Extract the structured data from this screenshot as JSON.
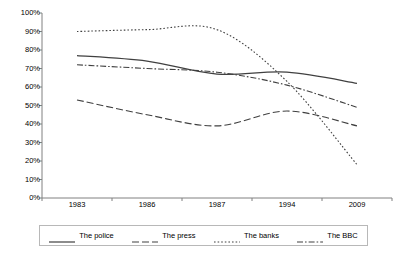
{
  "chart_data": {
    "type": "line",
    "title": "",
    "xlabel": "",
    "ylabel": "",
    "categories": [
      "1983",
      "1986",
      "1987",
      "1994",
      "2009"
    ],
    "ylim": [
      0,
      100
    ],
    "y_ticks": [
      "0%",
      "10%",
      "20%",
      "30%",
      "40%",
      "50%",
      "60%",
      "70%",
      "80%",
      "90%",
      "100%"
    ],
    "y_tick_values": [
      0,
      10,
      20,
      30,
      40,
      50,
      60,
      70,
      80,
      90,
      100
    ],
    "grid": false,
    "legend_position": "bottom",
    "series": [
      {
        "name": "The police",
        "style": "solid",
        "color": "#404040",
        "values": [
          77,
          74,
          67,
          68,
          62
        ]
      },
      {
        "name": "The press",
        "style": "dashed",
        "color": "#404040",
        "values": [
          53,
          45,
          39,
          47,
          39
        ]
      },
      {
        "name": "The banks",
        "style": "dotted",
        "color": "#404040",
        "values": [
          90,
          91,
          91,
          63,
          18
        ]
      },
      {
        "name": "The BBC",
        "style": "dashdot",
        "color": "#404040",
        "values": [
          72,
          70,
          68,
          61,
          49
        ]
      }
    ]
  },
  "legend": {
    "items": [
      {
        "label": "The police",
        "swatch": "solid-line-swatch"
      },
      {
        "label": "The press",
        "swatch": "dashed-line-swatch"
      },
      {
        "label": "The banks",
        "swatch": "dotted-line-swatch"
      },
      {
        "label": "The BBC",
        "swatch": "dashdot-line-swatch"
      }
    ]
  },
  "axes": {
    "y_tick_labels": [
      "100%",
      "90%",
      "80%",
      "70%",
      "60%",
      "50%",
      "40%",
      "30%",
      "20%",
      "10%",
      "0%"
    ],
    "x_tick_labels": [
      "1983",
      "1986",
      "1987",
      "1994",
      "2009"
    ]
  }
}
